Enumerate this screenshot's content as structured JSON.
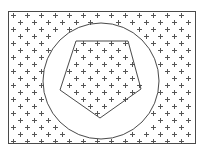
{
  "figure": {
    "colors": {
      "background": "#ffffff",
      "outline": "#4a4a4a",
      "marker": "#555555"
    },
    "fill_rule": "evenodd",
    "marker_glyph": "+",
    "shapes": [
      {
        "id": "outer-rectangle",
        "type": "rectangle",
        "filled_with_markers": true
      },
      {
        "id": "middle-circle",
        "type": "circle",
        "filled_with_markers": false
      },
      {
        "id": "inner-pentagon",
        "type": "pentagon",
        "filled_with_markers": true
      }
    ]
  }
}
